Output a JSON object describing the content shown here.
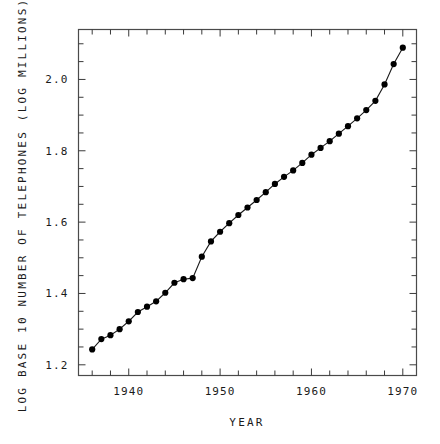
{
  "chart_data": {
    "type": "line",
    "title": "",
    "subtitle": "",
    "xlabel": "YEAR",
    "ylabel": "LOG BASE 10 NUMBER OF TELEPHONES (LOG MILLIONS)",
    "xlim": [
      1934.5,
      1971.5
    ],
    "ylim": [
      1.17,
      2.14
    ],
    "grid": false,
    "legend": null,
    "marker": "filled-circle",
    "line_color": "#1a1a1a",
    "marker_color": "#000000",
    "xticks_labeled": [
      "1940",
      "1950",
      "1960",
      "1970"
    ],
    "xtick_values": [
      1940,
      1950,
      1960,
      1970
    ],
    "xtick_minor_step": 2,
    "yticks_labeled": [
      "1.2",
      "1.4",
      "1.6",
      "1.8",
      "2.0"
    ],
    "ytick_values": [
      1.2,
      1.4,
      1.6,
      1.8,
      2.0
    ],
    "ytick_minor_step": 0.05,
    "x": [
      1936,
      1937,
      1938,
      1939,
      1940,
      1941,
      1942,
      1943,
      1944,
      1945,
      1946,
      1947,
      1948,
      1949,
      1950,
      1951,
      1952,
      1953,
      1954,
      1955,
      1956,
      1957,
      1958,
      1959,
      1960,
      1961,
      1962,
      1963,
      1964,
      1965,
      1966,
      1967,
      1968,
      1969,
      1970
    ],
    "values": [
      1.243,
      1.272,
      1.283,
      1.3,
      1.322,
      1.348,
      1.363,
      1.378,
      1.402,
      1.43,
      1.44,
      1.443,
      1.503,
      1.546,
      1.573,
      1.597,
      1.62,
      1.641,
      1.662,
      1.684,
      1.707,
      1.727,
      1.745,
      1.766,
      1.789,
      1.808,
      1.827,
      1.848,
      1.869,
      1.891,
      1.914,
      1.94,
      1.986,
      2.043,
      2.089
    ],
    "series": [
      {
        "name": "Telephones",
        "values": [
          1.243,
          1.272,
          1.283,
          1.3,
          1.322,
          1.348,
          1.363,
          1.378,
          1.402,
          1.43,
          1.44,
          1.443,
          1.503,
          1.546,
          1.573,
          1.597,
          1.62,
          1.641,
          1.662,
          1.684,
          1.707,
          1.727,
          1.745,
          1.766,
          1.789,
          1.808,
          1.827,
          1.848,
          1.869,
          1.891,
          1.914,
          1.94,
          1.986,
          2.043,
          2.089
        ]
      }
    ]
  },
  "plot": {
    "frame_color": "#4a4a4a",
    "background": "#ffffff"
  }
}
